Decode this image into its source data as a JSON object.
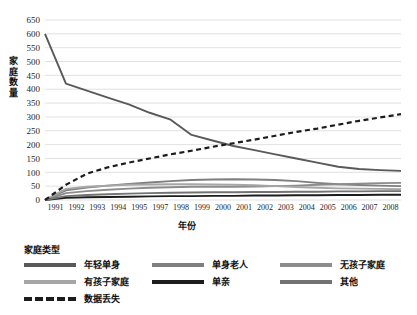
{
  "chart_data": {
    "type": "line",
    "title": "",
    "xlabel": "年份",
    "ylabel": "家庭数量",
    "legend_title": "家庭类型",
    "legend_position": "bottom",
    "grid": true,
    "x": [
      1991,
      1992,
      1993,
      1994,
      1995,
      1996,
      1997,
      1998,
      1999,
      2000,
      2001,
      2002,
      2003,
      2004,
      2005,
      2006,
      2007,
      2008
    ],
    "xtick_labels": [
      "1991",
      "1992",
      "1993",
      "1994",
      "1995",
      "1997",
      "1998",
      "1999",
      "2000",
      "2001",
      "2002",
      "2003",
      "2004",
      "2005",
      "2006",
      "2007",
      "2008"
    ],
    "ytick_labels": [
      "0",
      "50",
      "100",
      "150",
      "200",
      "250",
      "300",
      "350",
      "400",
      "450",
      "500",
      "550",
      "600",
      "650"
    ],
    "yticks": [
      0,
      50,
      100,
      150,
      200,
      250,
      300,
      350,
      400,
      450,
      500,
      550,
      600,
      650
    ],
    "ylim": [
      0,
      650
    ],
    "xlim": [
      1991,
      2008
    ],
    "series": [
      {
        "name": "年轻单身",
        "color": "#595959",
        "style": "solid",
        "values": [
          600,
          420,
          395,
          370,
          345,
          315,
          290,
          235,
          215,
          195,
          180,
          165,
          150,
          135,
          120,
          112,
          108,
          105
        ]
      },
      {
        "name": "单身老人",
        "color": "#7f7f7f",
        "style": "solid",
        "values": [
          0,
          35,
          45,
          52,
          58,
          63,
          68,
          72,
          74,
          75,
          74,
          72,
          68,
          62,
          57,
          54,
          52,
          50
        ]
      },
      {
        "name": "无孩子家庭",
        "color": "#8c8c8c",
        "style": "solid",
        "values": [
          0,
          25,
          32,
          37,
          41,
          44,
          46,
          48,
          48,
          48,
          49,
          50,
          52,
          55,
          57,
          59,
          61,
          62
        ]
      },
      {
        "name": "有孩子家庭",
        "color": "#a6a6a6",
        "style": "solid",
        "values": [
          0,
          40,
          48,
          52,
          55,
          56,
          57,
          57,
          56,
          55,
          53,
          50,
          47,
          44,
          42,
          41,
          40,
          39
        ]
      },
      {
        "name": "单亲",
        "color": "#1c1c1c",
        "style": "solid",
        "values": [
          0,
          8,
          10,
          11,
          12,
          13,
          14,
          14,
          15,
          15,
          16,
          16,
          17,
          17,
          18,
          18,
          19,
          19
        ]
      },
      {
        "name": "其他",
        "color": "#737373",
        "style": "solid",
        "values": [
          0,
          14,
          18,
          21,
          23,
          25,
          26,
          27,
          28,
          28,
          29,
          29,
          30,
          30,
          31,
          31,
          32,
          32
        ]
      },
      {
        "name": "数据丢失",
        "color": "#1c1c1c",
        "style": "dashed",
        "values": [
          0,
          55,
          95,
          118,
          135,
          150,
          165,
          178,
          192,
          205,
          218,
          232,
          246,
          258,
          272,
          286,
          298,
          310
        ]
      }
    ]
  },
  "axes": {
    "ylabel_chars": [
      "家",
      "庭",
      "数",
      "量"
    ],
    "xlabel": "年份"
  },
  "legend": {
    "title": "家庭类型",
    "rows": [
      [
        {
          "label": "年轻单身",
          "color": "#595959",
          "style": "solid"
        },
        {
          "label": "单身老人",
          "color": "#7f7f7f",
          "style": "solid"
        },
        {
          "label": "无孩子家庭",
          "color": "#8c8c8c",
          "style": "solid"
        }
      ],
      [
        {
          "label": "有孩子家庭",
          "color": "#a6a6a6",
          "style": "solid"
        },
        {
          "label": "单亲",
          "color": "#1c1c1c",
          "style": "solid"
        },
        {
          "label": "其他",
          "color": "#737373",
          "style": "solid"
        }
      ],
      [
        {
          "label": "数据丢失",
          "color": "#1c1c1c",
          "style": "dashed"
        }
      ]
    ]
  },
  "colors": {
    "gridline": "#d9d9d9",
    "text": "#262626",
    "background": "#ffffff"
  }
}
